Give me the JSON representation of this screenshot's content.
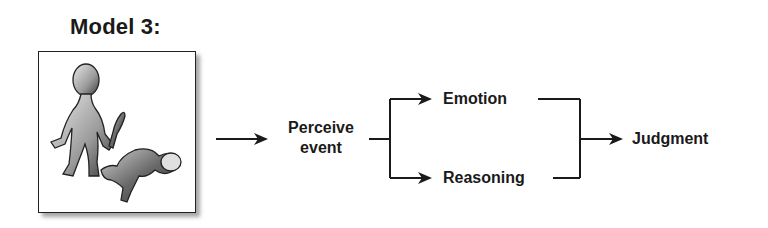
{
  "title": "Model 3:",
  "picture": {
    "description": "Illustration of a standing figure holding a knife next to a crouching figure",
    "icon": "violent-scene-illustration"
  },
  "nodes": {
    "perceive": "Perceive event",
    "perceive_line1": "Perceive",
    "perceive_line2": "event",
    "emotion": "Emotion",
    "reasoning": "Reasoning",
    "judgment": "Judgment"
  },
  "edges": [
    {
      "from": "picture",
      "to": "perceive"
    },
    {
      "from": "perceive",
      "to": "emotion"
    },
    {
      "from": "perceive",
      "to": "reasoning"
    },
    {
      "from": "emotion",
      "to": "judgment"
    },
    {
      "from": "reasoning",
      "to": "judgment"
    }
  ],
  "colors": {
    "ink": "#1a1a1a",
    "background": "#ffffff"
  }
}
